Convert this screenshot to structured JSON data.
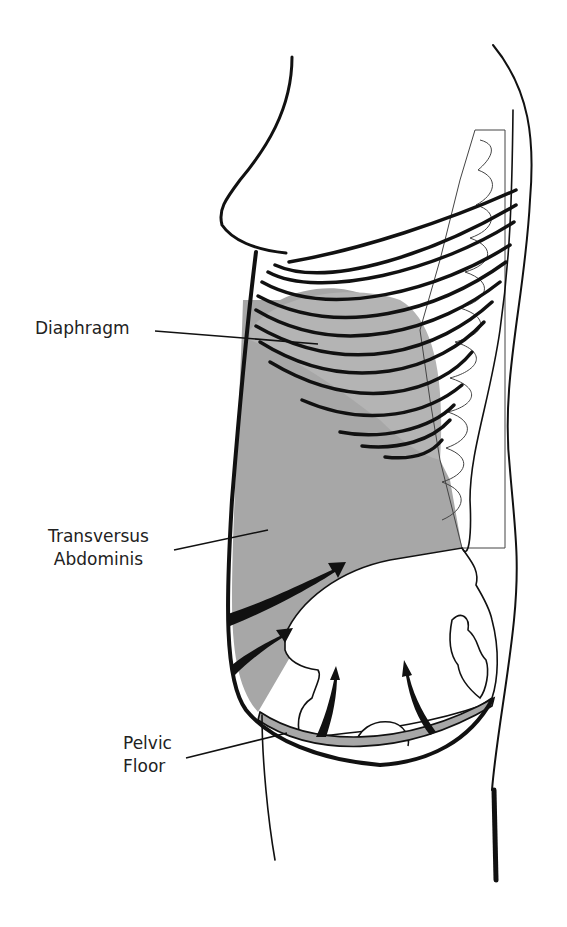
{
  "diagram": {
    "type": "anatomical-illustration",
    "colors": {
      "background": "#ffffff",
      "outline": "#111111",
      "muscle_fill": "#a7a7a7",
      "label_text": "#222222"
    },
    "labels": {
      "diaphragm": "Diaphragm",
      "transversus_line1": "Transversus",
      "transversus_line2": "Abdominis",
      "pelvic_line1": "Pelvic",
      "pelvic_line2": "Floor"
    }
  }
}
